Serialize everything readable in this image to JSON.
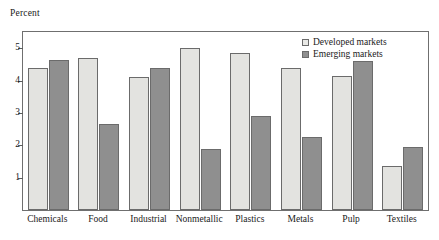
{
  "chart_data": {
    "type": "bar",
    "title": "",
    "subtitle": "",
    "xlabel": "",
    "ylabel": "Percent",
    "ylim": [
      0,
      5.5
    ],
    "yticks": [
      1,
      2,
      3,
      4,
      5
    ],
    "ytick_labels": [
      "1",
      "2",
      "3",
      "4",
      "5"
    ],
    "grid": false,
    "legend_position": "top-right",
    "categories": [
      "Chemicals",
      "Food",
      "Industrial",
      "Nonmetallic",
      "Plastics",
      "Metals",
      "Pulp",
      "Textiles"
    ],
    "series": [
      {
        "name": "Developed markets",
        "color": "#e3e3e0",
        "values": [
          4.4,
          4.7,
          4.1,
          5.0,
          4.85,
          4.4,
          4.15,
          1.35
        ]
      },
      {
        "name": "Emerging markets",
        "color": "#8f8f8f",
        "values": [
          4.65,
          2.65,
          4.4,
          1.9,
          2.9,
          2.25,
          4.6,
          1.95
        ]
      }
    ]
  },
  "legend": {
    "items": [
      {
        "label": "Developed markets",
        "swatch": "legend-swatch-developed"
      },
      {
        "label": "Emerging markets",
        "swatch": "legend-swatch-emerging"
      }
    ]
  }
}
